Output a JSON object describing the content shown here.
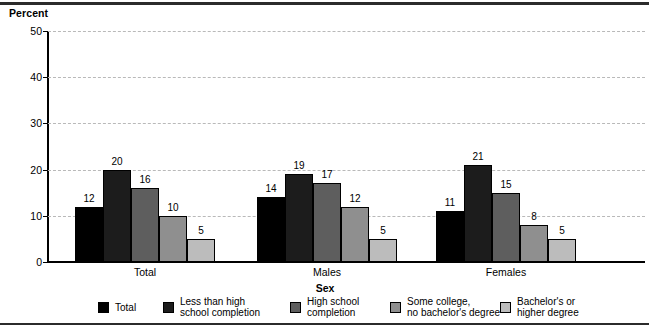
{
  "chart_data": {
    "type": "bar",
    "title": "",
    "ylabel": "Percent",
    "xlabel": "Sex",
    "ylim": [
      0,
      50
    ],
    "yticks": [
      0,
      10,
      20,
      30,
      40,
      50
    ],
    "grid": true,
    "legend_position": "bottom",
    "categories": [
      "Total",
      "Males",
      "Females"
    ],
    "series": [
      {
        "name": "Total",
        "values": [
          12,
          14,
          11
        ],
        "color": "#000000"
      },
      {
        "name": "Less than high\nschool completion",
        "values": [
          20,
          19,
          21
        ],
        "color": "#1c1c1c"
      },
      {
        "name": "High school\ncompletion",
        "values": [
          16,
          17,
          15
        ],
        "color": "#5e5e5e"
      },
      {
        "name": "Some college,\nno bachelor's degree",
        "values": [
          10,
          12,
          8
        ],
        "color": "#8f8f8f"
      },
      {
        "name": "Bachelor's or\nhigher degree",
        "values": [
          5,
          5,
          5
        ],
        "color": "#bcbcbc"
      }
    ]
  },
  "chart": {
    "ylabel": "Percent",
    "xlabel": "Sex",
    "ytick_labels": [
      "0",
      "10",
      "20",
      "30",
      "40",
      "50"
    ],
    "group_labels": [
      "Total",
      "Males",
      "Females"
    ],
    "legend": [
      {
        "label": "Total",
        "color": "#000000"
      },
      {
        "label": "Less than high\nschool completion",
        "color": "#1c1c1c"
      },
      {
        "label": "High school\ncompletion",
        "color": "#5e5e5e"
      },
      {
        "label": "Some college,\nno bachelor's degree",
        "color": "#8f8f8f"
      },
      {
        "label": "Bachelor's or\nhigher degree",
        "color": "#bcbcbc"
      }
    ]
  }
}
